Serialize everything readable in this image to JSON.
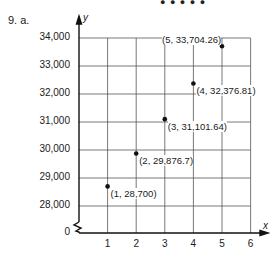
{
  "header": {
    "problem_label": "9. a.",
    "top_dots": "● ● ● ● ●"
  },
  "chart_data": {
    "type": "scatter",
    "title": "",
    "xlabel": "x",
    "ylabel": "y",
    "x": [
      1,
      2,
      3,
      4,
      5
    ],
    "y": [
      28700,
      29876.7,
      31101.64,
      32376.81,
      33704.26
    ],
    "point_labels": [
      "(1, 28,700)",
      "(2, 29,876.7)",
      "(3, 31,101.64)",
      "(4, 32,376.81)",
      "(5, 33,704.26)"
    ],
    "xticks": [
      "1",
      "2",
      "3",
      "4",
      "5",
      "6"
    ],
    "yticks": [
      "0",
      "28,000",
      "29,000",
      "30,000",
      "31,000",
      "32,000",
      "33,000",
      "34,000"
    ],
    "xlim": [
      0,
      6
    ],
    "ylim": [
      27000,
      34000
    ],
    "y_axis_break": true,
    "grid": true,
    "legend": null
  },
  "footer": {
    "partial_text": "... Yes ... the amount ... of the ... each ... f"
  }
}
